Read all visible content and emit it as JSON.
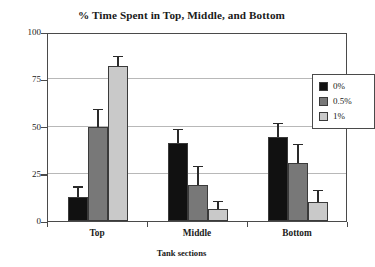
{
  "chart_data": {
    "type": "bar",
    "title": "% Time Spent in Top, Middle, and Bottom",
    "xlabel": "Tank sections",
    "ylabel": "% time",
    "categories": [
      "Top",
      "Middle",
      "Bottom"
    ],
    "ylim": [
      0,
      100
    ],
    "yticks": [
      0,
      25,
      50,
      75,
      100
    ],
    "ytick_labels": [
      "0",
      "25",
      "50",
      "75",
      "100"
    ],
    "grid": "horizontal",
    "legend_position": "top-right",
    "series": [
      {
        "name": "0%",
        "color": "#111111",
        "values": [
          12.5,
          41.5,
          44.5
        ],
        "errors": [
          5.5,
          7.0,
          7.0
        ]
      },
      {
        "name": "0.5%",
        "color": "#787878",
        "values": [
          50.0,
          19.0,
          30.5
        ],
        "errors": [
          9.0,
          10.0,
          10.0
        ]
      },
      {
        "name": "1%",
        "color": "#c9c9c9",
        "values": [
          82.0,
          6.5,
          10.0
        ],
        "errors": [
          5.0,
          4.0,
          6.0
        ]
      }
    ]
  }
}
